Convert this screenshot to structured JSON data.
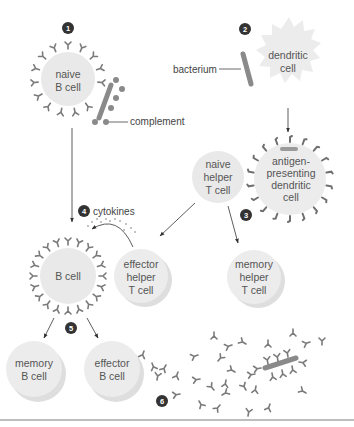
{
  "diagram": {
    "type": "immune-response-pathway",
    "steps": [
      {
        "number": "1"
      },
      {
        "number": "2"
      },
      {
        "number": "3"
      },
      {
        "number": "4"
      },
      {
        "number": "5"
      },
      {
        "number": "6"
      }
    ],
    "cells": {
      "naive_b_cell": [
        "naive",
        "B cell"
      ],
      "dendritic_cell": [
        "dendritic",
        "cell"
      ],
      "antigen_presenting_dendritic_cell": [
        "antigen-",
        "presenting",
        "dendritic",
        "cell"
      ],
      "naive_helper_t_cell": [
        "naive",
        "helper",
        "T cell"
      ],
      "b_cell": [
        "B cell"
      ],
      "effector_helper_t_cell": [
        "effector",
        "helper",
        "T cell"
      ],
      "memory_helper_t_cell": [
        "memory",
        "helper",
        "T cell"
      ],
      "memory_b_cell": [
        "memory",
        "B cell"
      ],
      "effector_b_cell": [
        "effector",
        "B cell"
      ]
    },
    "labels": {
      "complement": "complement",
      "bacterium": "bacterium",
      "cytokines": "cytokines"
    },
    "colors": {
      "cell_fill": "#e9e9e9",
      "cell_shadow": "#d8d8d8",
      "antibody": "#7a7a7a",
      "bacterium": "#8a8a8a",
      "number_badge": "#333333",
      "arrow": "#333333",
      "text": "#555555"
    }
  }
}
